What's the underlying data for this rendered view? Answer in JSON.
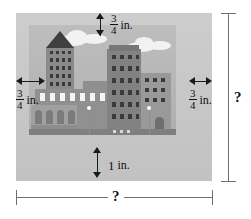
{
  "diagram": {
    "frame": {
      "name": "picture-frame",
      "color": "#c9c9c9"
    },
    "picture": {
      "name": "cityscape-illustration",
      "description": "grayscale city skyline with buildings, clouds and street lamps"
    },
    "measurements": {
      "top_margin": {
        "numerator": "3",
        "denominator": "4",
        "unit": "in."
      },
      "left_margin": {
        "numerator": "3",
        "denominator": "4",
        "unit": "in."
      },
      "right_margin": {
        "numerator": "3",
        "denominator": "4",
        "unit": "in."
      },
      "bottom_margin": {
        "whole": "1",
        "unit": "in."
      },
      "total_height": {
        "value": "?"
      },
      "total_width": {
        "value": "?"
      }
    }
  }
}
